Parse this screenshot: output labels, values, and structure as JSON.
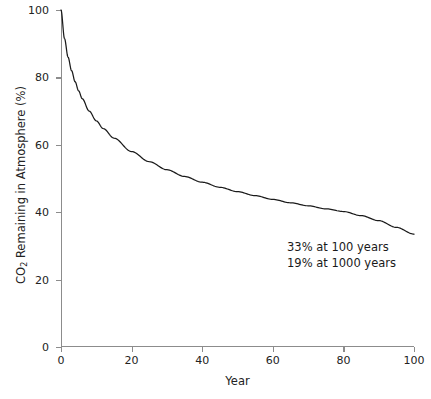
{
  "chart_data": {
    "type": "line",
    "title": "",
    "xlabel": "Year",
    "ylabel": "CO2 Remaining in Atmosphere (%)",
    "ylabel_parts": {
      "prefix": "CO",
      "subscript": "2",
      "suffix": " Remaining in Atmosphere (%)"
    },
    "xlim": [
      0,
      100
    ],
    "ylim": [
      0,
      100
    ],
    "grid": false,
    "legend": false,
    "line_color": "#1a1a1a",
    "axis_color": "#8c8c8c",
    "background_color": "#ffffff",
    "xticks": [
      0,
      20,
      40,
      60,
      80,
      100
    ],
    "xticklabels": [
      "0",
      "20",
      "40",
      "60",
      "80",
      "100"
    ],
    "yticks": [
      0,
      20,
      40,
      60,
      80,
      100
    ],
    "yticklabels": [
      "0",
      "20",
      "40",
      "60",
      "80",
      "100"
    ],
    "x": [
      0,
      1,
      2,
      3,
      4,
      5,
      6,
      8,
      10,
      12,
      15,
      20,
      25,
      30,
      35,
      40,
      45,
      50,
      55,
      60,
      65,
      70,
      75,
      80,
      85,
      90,
      95,
      100
    ],
    "values": [
      100,
      91.5,
      86.0,
      82.0,
      78.7,
      76.0,
      73.7,
      70.0,
      67.1,
      64.8,
      62.0,
      58.0,
      55.0,
      52.6,
      50.6,
      48.9,
      47.4,
      46.1,
      44.9,
      43.8,
      42.8,
      41.9,
      41.0,
      40.2,
      39.0,
      37.5,
      35.5,
      33.5
    ],
    "series": [
      {
        "name": "CO2 remaining in atmosphere",
        "values": [
          100,
          91.5,
          86.0,
          82.0,
          78.7,
          76.0,
          73.7,
          70.0,
          67.1,
          64.8,
          62.0,
          58.0,
          55.0,
          52.6,
          50.6,
          48.9,
          47.4,
          46.1,
          44.9,
          43.8,
          42.8,
          41.9,
          41.0,
          40.2,
          39.0,
          37.5,
          35.5,
          33.5
        ]
      }
    ],
    "annotations": [
      "33% at 100 years",
      "19% at 1000 years"
    ]
  },
  "caption": ""
}
